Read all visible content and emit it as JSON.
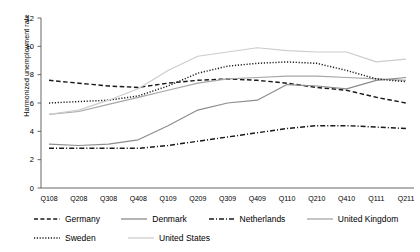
{
  "chart_data": {
    "type": "line",
    "title": "",
    "xlabel": "",
    "ylabel": "Harmonized unemployment rate",
    "ylim": [
      0,
      12
    ],
    "yticks": [
      0,
      2,
      4,
      6,
      8,
      10,
      12
    ],
    "grid": false,
    "legend_position": "bottom",
    "categories": [
      "Q108",
      "Q208",
      "Q308",
      "Q408",
      "Q109",
      "Q209",
      "Q309",
      "Q409",
      "Q110",
      "Q210",
      "Q410",
      "Q111",
      "Q211"
    ],
    "series": [
      {
        "name": "Germany",
        "style": "dashed",
        "color": "#1a1a1a",
        "values": [
          7.6,
          7.4,
          7.2,
          7.1,
          7.4,
          7.6,
          7.7,
          7.6,
          7.4,
          7.1,
          6.9,
          6.4,
          6.0
        ]
      },
      {
        "name": "Denmark",
        "style": "solid",
        "color": "#8c8c8c",
        "values": [
          3.1,
          3.0,
          3.1,
          3.4,
          4.4,
          5.5,
          6.0,
          6.2,
          7.3,
          7.2,
          7.0,
          7.6,
          7.8
        ]
      },
      {
        "name": "Netherlands",
        "style": "dashdot",
        "color": "#1a1a1a",
        "values": [
          2.8,
          2.8,
          2.8,
          2.8,
          3.0,
          3.3,
          3.6,
          3.9,
          4.2,
          4.4,
          4.4,
          4.3,
          4.2
        ]
      },
      {
        "name": "United Kingdom",
        "style": "solid",
        "color": "#a6a6a6",
        "values": [
          5.2,
          5.4,
          5.9,
          6.4,
          6.9,
          7.4,
          7.7,
          7.8,
          7.9,
          7.9,
          7.8,
          7.7,
          7.6
        ]
      },
      {
        "name": "Sweden",
        "style": "dotted",
        "color": "#1a1a1a",
        "values": [
          6.0,
          6.1,
          6.2,
          6.5,
          7.2,
          8.1,
          8.6,
          8.8,
          8.9,
          8.8,
          8.3,
          7.7,
          7.5
        ]
      },
      {
        "name": "United States",
        "style": "solid",
        "color": "#cccccc",
        "values": [
          5.2,
          5.5,
          6.2,
          7.0,
          8.3,
          9.3,
          9.6,
          9.9,
          9.7,
          9.6,
          9.6,
          8.9,
          9.1
        ]
      }
    ]
  },
  "axis": {
    "yticks": [
      "12",
      "10",
      "8",
      "6",
      "4",
      "2",
      "0"
    ],
    "ylabel": "Harmonized unemployment rate",
    "xticks": [
      "Q108",
      "Q208",
      "Q308",
      "Q408",
      "Q109",
      "Q209",
      "Q309",
      "Q409",
      "Q110",
      "Q210",
      "Q410",
      "Q111",
      "Q211"
    ]
  },
  "legend": {
    "row1": [
      {
        "label": "Germany"
      },
      {
        "label": "Denmark"
      },
      {
        "label": "Netherlands"
      },
      {
        "label": "United Kingdom"
      }
    ],
    "row2": [
      {
        "label": "Sweden"
      },
      {
        "label": "United States"
      }
    ]
  }
}
